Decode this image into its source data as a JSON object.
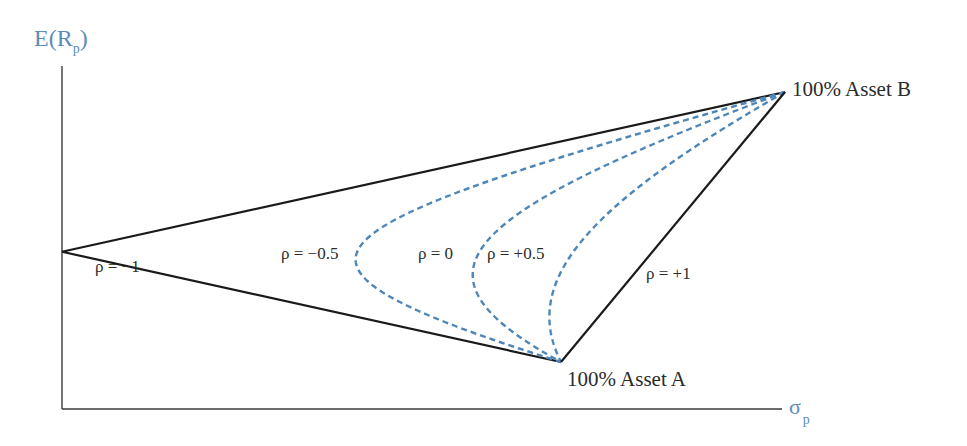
{
  "chart_data": {
    "type": "line",
    "title": "",
    "xlabel": "σp",
    "ylabel": "E(Rp)",
    "axes": {
      "y_label_main": "E(R",
      "y_label_sub": "p",
      "y_label_close": ")",
      "x_label_main": "σ",
      "x_label_sub": "p"
    },
    "assets": {
      "A": {
        "label": "100% Asset A",
        "sigma_px": 499,
        "return_px": 47
      },
      "B": {
        "label": "100% Asset B",
        "sigma_px": 723,
        "return_px": 317
      }
    },
    "series": [
      {
        "name": "ρ = −1",
        "rho": -1,
        "style": "solid",
        "color": "#1a1a1a"
      },
      {
        "name": "ρ = −0.5",
        "rho": -0.5,
        "style": "dashed",
        "color": "#4f86b8"
      },
      {
        "name": "ρ = 0",
        "rho": 0,
        "style": "dashed",
        "color": "#4f86b8"
      },
      {
        "name": "ρ = +0.5",
        "rho": 0.5,
        "style": "dashed",
        "color": "#4f86b8"
      },
      {
        "name": "ρ = +1",
        "rho": 1,
        "style": "solid",
        "color": "#1a1a1a"
      }
    ],
    "annotations": [
      {
        "text": "ρ = −1",
        "x": 95,
        "y": 272
      },
      {
        "text": "ρ = −0.5",
        "x": 281,
        "y": 259
      },
      {
        "text": "ρ = 0",
        "x": 418,
        "y": 259
      },
      {
        "text": "ρ = +0.5",
        "x": 487,
        "y": 259
      },
      {
        "text": "ρ = +1",
        "x": 646,
        "y": 279
      }
    ],
    "grid": false,
    "legend": "none"
  },
  "colors": {
    "axis": "#3a3a3a",
    "solid": "#1a1a1a",
    "dashed": "#4f86b8",
    "axis_label": "#5b8db8",
    "text": "#2b2b2b"
  }
}
